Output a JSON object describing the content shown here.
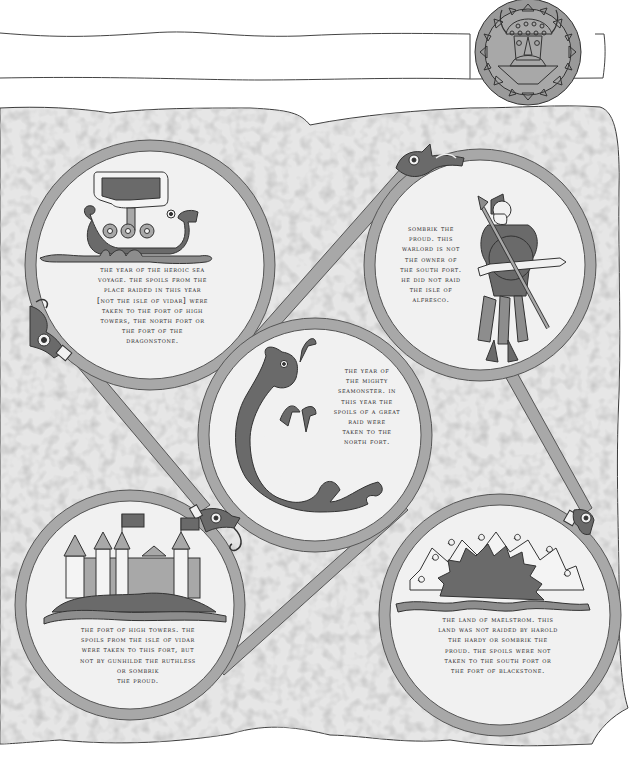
{
  "scene": {
    "type": "logic-puzzle-clue-sheet",
    "colors": {
      "parchment": "#e9e9e9",
      "parchment_edge": "#3a3a3a",
      "ring": "#a7a7a7",
      "ring_outline": "#555555",
      "ink_dark": "#5e5e5e",
      "ink_mid": "#8d8d8d",
      "ink_light": "#c2c2c2",
      "medallion": "#9a9a9a"
    }
  },
  "header": {
    "medallion_icon": "viking-helmet-face-medallion"
  },
  "clues": [
    {
      "id": "ship",
      "icon": "viking-longship-icon",
      "text": "the year of the heroic sea\nvoyage. the spoils from the\nplace raided in this year\n[not the isle of vidar] were\ntaken to the fort of high\ntowers, the north fort or\nthe fort of the\ndragonstone."
    },
    {
      "id": "warrior",
      "icon": "viking-warrior-spear-icon",
      "text": "sombrik the\nproud. this\nwarlord is not\nthe owner of\nthe south fort.\nhe did not raid\nthe isle of\nalfresco."
    },
    {
      "id": "seamonster",
      "icon": "sea-serpent-icon",
      "text": "the year of\nthe mighty\nseamonster. in\nthis year the\nspoils of a great\nraid were\ntaken to the\nnorth fort."
    },
    {
      "id": "castle",
      "icon": "castle-towers-icon",
      "text": "the fort of high towers. the\nspoils from the isle of vidar\nwere taken to this fort, but\nnot by gunhilde the ruthless\nor sombrik\nthe proud."
    },
    {
      "id": "sun",
      "icon": "sun-maelstrom-icon",
      "text": "the land of maelstrom. this\nland was not raided by harold\nthe hardy or sombrik the\nproud. the spoils were not\ntaken to the south fort or\nthe fort of blackstone."
    }
  ]
}
